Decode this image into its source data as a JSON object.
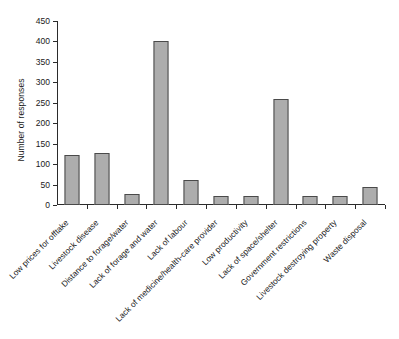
{
  "chart_data": {
    "type": "bar",
    "title": "",
    "xlabel": "",
    "ylabel": "Number of responses",
    "ylim": [
      0,
      450
    ],
    "yticks": [
      0,
      50,
      100,
      150,
      200,
      250,
      300,
      350,
      400,
      450
    ],
    "grid": false,
    "legend": "none",
    "bar_color": "#adadad",
    "bar_edge_color": "#4a4a4a",
    "axis_color": "#2b2b2b",
    "categories": [
      "Low prices for offtake",
      "Livestock disease",
      "Distance to forage/water",
      "Lack of forage and water",
      "Lack of labour",
      "Lack of medicine/health-care provider",
      "Low productivity",
      "Lack of space/shelter",
      "Government restrictions",
      "Livestock destroying property",
      "Waste disposal"
    ],
    "values": [
      122,
      128,
      27,
      401,
      61,
      23,
      22,
      259,
      23,
      23,
      45
    ]
  }
}
